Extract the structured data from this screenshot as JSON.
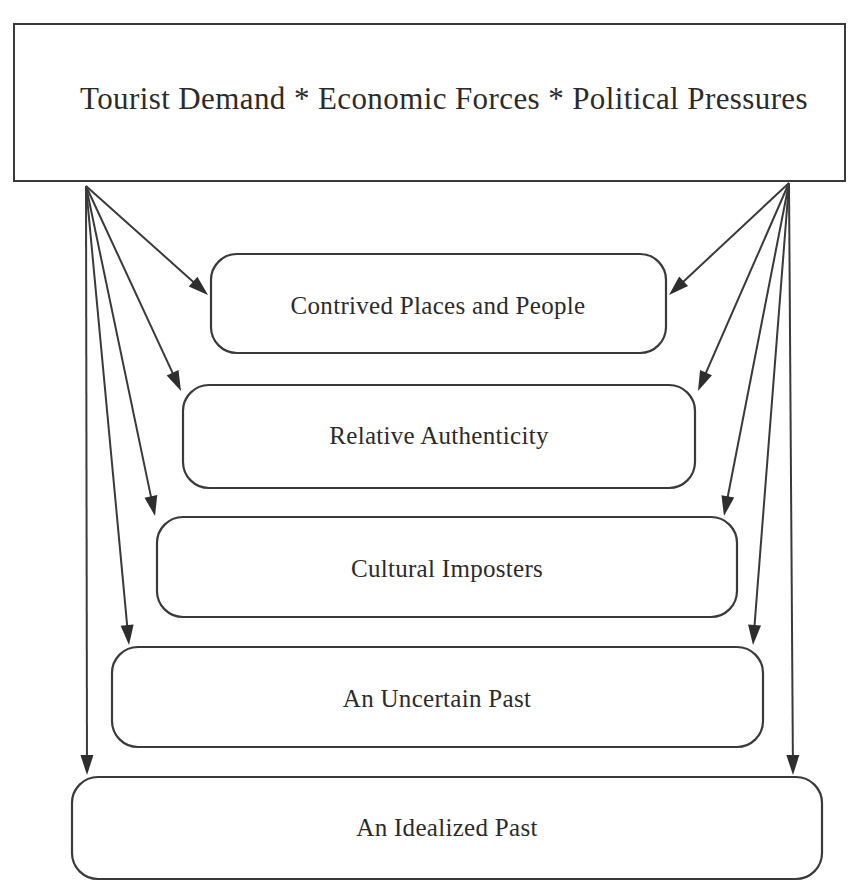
{
  "diagram": {
    "title_node": {
      "id": "forces-header",
      "text": "Tourist Demand *  Economic Forces *  Political Pressures",
      "shape": "rectangle",
      "x": 14,
      "y": 24,
      "width": 831,
      "height": 157,
      "label_x": 444,
      "label_y": 102
    },
    "nodes": [
      {
        "id": "contrived-places-and-people",
        "text": "Contrived Places and People",
        "shape": "rounded-rectangle",
        "x": 211,
        "y": 254,
        "width": 455,
        "height": 99,
        "radius": 26,
        "label_x": 438,
        "label_y": 308
      },
      {
        "id": "relative-authenticity",
        "text": "Relative Authenticity",
        "shape": "rounded-rectangle",
        "x": 183,
        "y": 385,
        "width": 512,
        "height": 103,
        "radius": 26,
        "label_x": 439,
        "label_y": 438
      },
      {
        "id": "cultural-imposters",
        "text": "Cultural Imposters",
        "shape": "rounded-rectangle",
        "x": 157,
        "y": 517,
        "width": 580,
        "height": 100,
        "radius": 26,
        "label_x": 447,
        "label_y": 571
      },
      {
        "id": "an-uncertain-past",
        "text": "An Uncertain Past",
        "shape": "rounded-rectangle",
        "x": 112,
        "y": 647,
        "width": 651,
        "height": 100,
        "radius": 26,
        "label_x": 437,
        "label_y": 701
      },
      {
        "id": "an-idealized-past",
        "text": "An Idealized Past",
        "shape": "rounded-rectangle",
        "x": 72,
        "y": 777,
        "width": 750,
        "height": 102,
        "radius": 26,
        "label_x": 447,
        "label_y": 830
      }
    ],
    "connectors": [
      {
        "id": "header-left-to-contrived",
        "from": "forces-header",
        "to": "contrived-places-and-people",
        "x1": 86,
        "y1": 186,
        "x2": 208,
        "y2": 295
      },
      {
        "id": "header-left-to-relative",
        "from": "forces-header",
        "to": "relative-authenticity",
        "x1": 86,
        "y1": 186,
        "x2": 181,
        "y2": 391
      },
      {
        "id": "header-left-to-imposters",
        "from": "forces-header",
        "to": "cultural-imposters",
        "x1": 86,
        "y1": 186,
        "x2": 155,
        "y2": 516
      },
      {
        "id": "header-left-to-uncertain",
        "from": "forces-header",
        "to": "an-uncertain-past",
        "x1": 86,
        "y1": 186,
        "x2": 129,
        "y2": 645
      },
      {
        "id": "header-left-to-idealized",
        "from": "forces-header",
        "to": "an-idealized-past",
        "x1": 86,
        "y1": 186,
        "x2": 87,
        "y2": 775
      },
      {
        "id": "header-right-to-contrived",
        "from": "forces-header",
        "to": "contrived-places-and-people",
        "x1": 789,
        "y1": 183,
        "x2": 669,
        "y2": 295
      },
      {
        "id": "header-right-to-relative",
        "from": "forces-header",
        "to": "relative-authenticity",
        "x1": 789,
        "y1": 183,
        "x2": 698,
        "y2": 391
      },
      {
        "id": "header-right-to-imposters",
        "from": "forces-header",
        "to": "cultural-imposters",
        "x1": 789,
        "y1": 183,
        "x2": 724,
        "y2": 516
      },
      {
        "id": "header-right-to-uncertain",
        "from": "forces-header",
        "to": "an-uncertain-past",
        "x1": 789,
        "y1": 183,
        "x2": 753,
        "y2": 645
      },
      {
        "id": "header-right-to-idealized",
        "from": "forces-header",
        "to": "an-idealized-past",
        "x1": 789,
        "y1": 183,
        "x2": 793,
        "y2": 775
      }
    ],
    "colors": {
      "stroke": "#3a3a3a",
      "fill": "#ffffff",
      "text": "#2b2b2b",
      "arrow": "#2e2e2e"
    }
  }
}
